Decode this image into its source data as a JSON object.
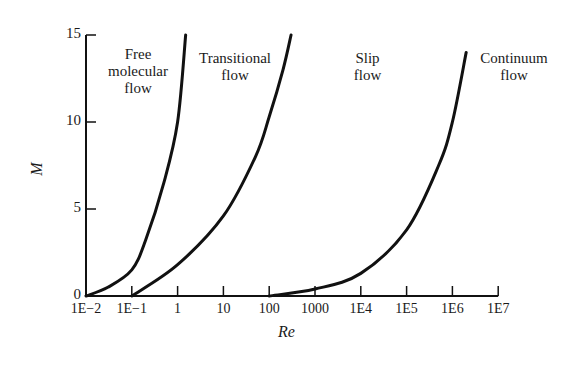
{
  "chart_data": {
    "type": "line",
    "title": "",
    "xlabel": "Re",
    "ylabel": "M",
    "xscale": "log",
    "xlim": [
      0.01,
      10000000
    ],
    "ylim": [
      0,
      15
    ],
    "grid": false,
    "x_ticks": [
      "1E−2",
      "1E−1",
      "1",
      "10",
      "100",
      "1000",
      "1E4",
      "1E5",
      "1E6",
      "1E7"
    ],
    "x_tick_values": [
      0.01,
      0.1,
      1,
      10,
      100,
      1000,
      10000,
      100000,
      1000000,
      10000000
    ],
    "y_ticks": [
      "0",
      "5",
      "10",
      "15"
    ],
    "y_tick_values": [
      0,
      5,
      10,
      15
    ],
    "regions": [
      {
        "name": "Free molecular flow",
        "lines": [
          "Free",
          "molecular",
          "flow"
        ]
      },
      {
        "name": "Transitional flow",
        "lines": [
          "Transitional",
          "flow"
        ]
      },
      {
        "name": "Slip flow",
        "lines": [
          "Slip",
          "flow"
        ]
      },
      {
        "name": "Continuum flow",
        "lines": [
          "Continuum",
          "flow"
        ]
      }
    ],
    "series": [
      {
        "name": "Free molecular / Transitional boundary",
        "points": [
          [
            0.01,
            0
          ],
          [
            0.03,
            0.5
          ],
          [
            0.1,
            1.5
          ],
          [
            0.2,
            3.2
          ],
          [
            0.5,
            6.5
          ],
          [
            1,
            10
          ],
          [
            1.5,
            15
          ]
        ]
      },
      {
        "name": "Transitional / Slip boundary",
        "points": [
          [
            0.1,
            0
          ],
          [
            1,
            1.8
          ],
          [
            10,
            4.6
          ],
          [
            50,
            8
          ],
          [
            100,
            10.3
          ],
          [
            200,
            13
          ],
          [
            300,
            15
          ]
        ]
      },
      {
        "name": "Slip / Continuum boundary",
        "points": [
          [
            100,
            0
          ],
          [
            1000,
            0.4
          ],
          [
            10000,
            1.3
          ],
          [
            100000,
            3.8
          ],
          [
            500000,
            7.5
          ],
          [
            1000000,
            10
          ],
          [
            2000000,
            14
          ]
        ]
      }
    ]
  }
}
